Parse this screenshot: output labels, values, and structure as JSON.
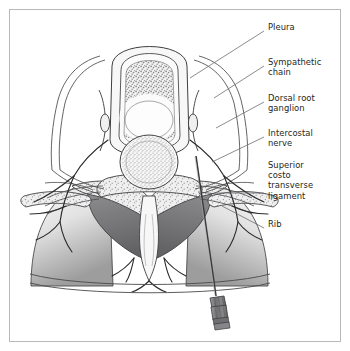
{
  "figure": {
    "border_color": "#b9b9b9",
    "background": "#ffffff",
    "ink_color": "#231f20",
    "line_color": "#58595b",
    "leader_color": "#6d6e71"
  },
  "labels": [
    {
      "id": "pleura",
      "text": "Pleura",
      "x": 268,
      "y": 27,
      "leader": {
        "x1": 264,
        "y1": 31,
        "x2": 190,
        "y2": 78
      }
    },
    {
      "id": "sympathetic",
      "text": "Sympathetic\nchain",
      "x": 268,
      "y": 62,
      "leader": {
        "x1": 264,
        "y1": 66,
        "x2": 214,
        "y2": 98
      }
    },
    {
      "id": "dorsal-root",
      "text": "Dorsal root\nganglion",
      "x": 268,
      "y": 98,
      "leader": {
        "x1": 264,
        "y1": 102,
        "x2": 216,
        "y2": 128
      }
    },
    {
      "id": "intercostal",
      "text": "Intercostal\nnerve",
      "x": 268,
      "y": 133,
      "leader": {
        "x1": 264,
        "y1": 137,
        "x2": 212,
        "y2": 162
      }
    },
    {
      "id": "ligament",
      "text": "Superior\ncosto\ntransverse\nligament",
      "x": 268,
      "y": 165,
      "leader": {
        "x1": 264,
        "y1": 193,
        "x2": 215,
        "y2": 193
      }
    },
    {
      "id": "rib",
      "text": "Rib",
      "x": 268,
      "y": 224,
      "leader": {
        "x1": 264,
        "y1": 228,
        "x2": 222,
        "y2": 206
      }
    }
  ],
  "structures": {
    "spinal_cord": "dural-sac-with-grey-matter",
    "vertebral_body": "vertebral-body-stippled",
    "lungs": "lung-fields-gradient",
    "muscles": "paraspinal-muscles-dark",
    "spinous_process": "spinous-process",
    "needle": "block-needle-with-hub",
    "skin_line": "skin-and-fascia-line"
  },
  "colors": {
    "lung_light": "#f3f3f3",
    "lung_dark": "#9a9a9a",
    "muscle_dark": "#6e6e70",
    "muscle_mid": "#8d8d8f",
    "tissue_fill": "#ededed",
    "tissue_pale": "#f6f6f6",
    "stipple": "#8a8a8c",
    "needle_hub": "#7e7e80",
    "outline": "#3a3a3c"
  }
}
